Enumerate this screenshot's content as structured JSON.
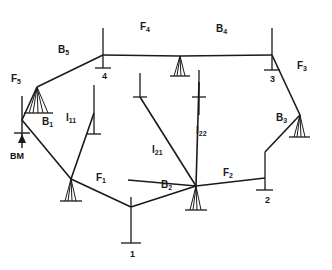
{
  "diagram": {
    "background_color": "#ffffff",
    "line_color": "#1a1a1a",
    "member_labels": [
      {
        "id": "F5",
        "base": "F",
        "sub": "5",
        "text": "F5",
        "x": 11,
        "y": 74
      },
      {
        "id": "B5",
        "base": "B",
        "sub": "5",
        "text": "B5",
        "x": 58,
        "y": 45
      },
      {
        "id": "F4",
        "base": "F",
        "sub": "4",
        "text": "F4",
        "x": 140,
        "y": 22
      },
      {
        "id": "B4",
        "base": "B",
        "sub": "4",
        "text": "B4",
        "x": 216,
        "y": 24
      },
      {
        "id": "F3",
        "base": "F",
        "sub": "3",
        "text": "F3",
        "x": 297,
        "y": 61
      },
      {
        "id": "B3",
        "base": "B",
        "sub": "3",
        "text": "B3",
        "x": 276,
        "y": 113
      },
      {
        "id": "B1",
        "base": "B",
        "sub": "1",
        "text": "B1",
        "x": 42,
        "y": 117
      },
      {
        "id": "I11",
        "base": "I",
        "sub": "11",
        "text": "I11",
        "x": 66,
        "y": 113
      },
      {
        "id": "I21",
        "base": "I",
        "sub": "21",
        "text": "I21",
        "x": 152,
        "y": 145
      },
      {
        "id": "I22",
        "base": "I",
        "sub": "22",
        "text": "I22",
        "x": 196,
        "y": 126
      },
      {
        "id": "F1",
        "base": "F",
        "sub": "1",
        "text": "F1",
        "x": 96,
        "y": 173
      },
      {
        "id": "B2",
        "base": "B",
        "sub": "2",
        "text": "B2",
        "x": 161,
        "y": 180
      },
      {
        "id": "F2",
        "base": "F",
        "sub": "2",
        "text": "F2",
        "x": 223,
        "y": 168
      }
    ],
    "station_labels": [
      {
        "id": "station-4",
        "text": "4",
        "x": 102,
        "y": 72
      },
      {
        "id": "station-3",
        "text": "3",
        "x": 270,
        "y": 75
      },
      {
        "id": "station-2",
        "text": "2",
        "x": 265,
        "y": 196
      },
      {
        "id": "station-1",
        "text": "1",
        "x": 130,
        "y": 250
      }
    ],
    "benchmark": {
      "id": "BM",
      "text": "BM",
      "x": 10,
      "y": 152
    },
    "nodes": {
      "apex_left": {
        "x": 37,
        "y": 87
      },
      "node4": {
        "x": 103,
        "y": 55
      },
      "center_top_support": {
        "x": 180,
        "y": 55
      },
      "node3": {
        "x": 272,
        "y": 55
      },
      "right_support": {
        "x": 300,
        "y": 115
      },
      "node2": {
        "x": 265,
        "y": 178
      },
      "center_support": {
        "x": 196,
        "y": 186
      },
      "node1": {
        "x": 131,
        "y": 223
      },
      "left_joint": {
        "x": 71,
        "y": 179
      },
      "bm_post": {
        "x": 22,
        "y": 96
      }
    }
  }
}
